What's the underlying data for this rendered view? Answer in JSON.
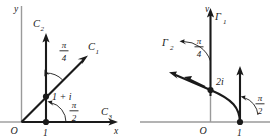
{
  "figure": {
    "panels": [
      {
        "id": "left",
        "name": "z-plane",
        "axes": {
          "x_label": "x",
          "y_label": "y",
          "origin_label": "O"
        },
        "points": [
          {
            "name": "point-one",
            "label": "1"
          },
          {
            "name": "point-one-plus-i",
            "label": "1 + i"
          }
        ],
        "curves": [
          {
            "name": "curve-c1",
            "label": "C",
            "subscript": "1"
          },
          {
            "name": "curve-c2",
            "label": "C",
            "subscript": "2"
          },
          {
            "name": "curve-c3",
            "label": "C",
            "subscript": "3"
          }
        ],
        "angles": [
          {
            "name": "angle-pi-over-4",
            "numerator": "π",
            "denominator": "4"
          },
          {
            "name": "angle-pi-over-2",
            "numerator": "π",
            "denominator": "2"
          }
        ]
      },
      {
        "id": "right",
        "name": "w-plane",
        "axes": {
          "v_label": "v",
          "origin_label": "O"
        },
        "points": [
          {
            "name": "point-one",
            "label": "1"
          },
          {
            "name": "point-two-i",
            "label": "2i"
          }
        ],
        "curves": [
          {
            "name": "curve-gamma1",
            "label": "Γ",
            "subscript": "1"
          },
          {
            "name": "curve-gamma2",
            "label": "Γ",
            "subscript": "2"
          }
        ],
        "angles": [
          {
            "name": "angle-pi-over-4",
            "numerator": "π",
            "denominator": "4"
          },
          {
            "name": "angle-pi-over-2",
            "numerator": "π",
            "denominator": "2"
          }
        ]
      }
    ],
    "colors": {
      "ink": "#1a1a1a",
      "axis_light": "#9a9a9a",
      "background": "#ffffff"
    }
  }
}
